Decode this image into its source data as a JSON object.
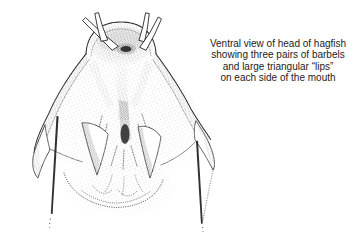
{
  "page": {
    "background_color": "#ffffff",
    "ink_color": "#1b1b1b"
  },
  "caption": {
    "lines": [
      "Ventral view of head of hagfish",
      "showing three pairs of barbels",
      "and large triangular “lips”",
      "on each side of the mouth"
    ]
  },
  "illustration": {
    "subject": "hagfish-head-ventral-view",
    "style": "stipple-ink-drawing"
  }
}
